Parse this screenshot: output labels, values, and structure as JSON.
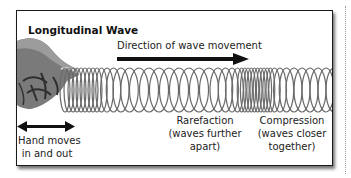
{
  "diagram": {
    "title": "Longitudinal Wave",
    "direction_label": "Direction of wave movement",
    "labels": {
      "hand": [
        "Hand moves",
        "in and out"
      ],
      "rarefaction": [
        "Rarefaction",
        "(waves further",
        "apart)"
      ],
      "compression": [
        "Compression",
        "(waves closer",
        "together)"
      ]
    },
    "icons": {
      "direction_arrow": "right-arrow-icon",
      "hand_motion_arrow": "double-headed-arrow-icon",
      "hand": "hand-illustration",
      "spring": "spring-coil"
    },
    "colors": {
      "border": "#1a1a1a",
      "spring": "#6a6a6a",
      "arrow": "#111111",
      "text": "#222222",
      "hand": "#6f6f6f"
    }
  }
}
